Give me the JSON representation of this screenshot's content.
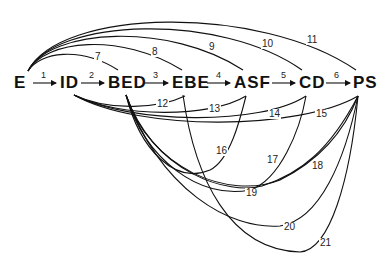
{
  "diagram": {
    "nodes": [
      {
        "id": "E",
        "label": "E",
        "x": 14,
        "y": 74
      },
      {
        "id": "ID",
        "label": "ID",
        "x": 60,
        "y": 74
      },
      {
        "id": "BED",
        "label": "BED",
        "x": 108,
        "y": 74
      },
      {
        "id": "EBE",
        "label": "EBE",
        "x": 172,
        "y": 74
      },
      {
        "id": "ASF",
        "label": "ASF",
        "x": 234,
        "y": 74
      },
      {
        "id": "CD",
        "label": "CD",
        "x": 299,
        "y": 74
      },
      {
        "id": "PS",
        "label": "PS",
        "x": 353,
        "y": 74
      }
    ],
    "sequential_edges": [
      {
        "label": "1",
        "from": "E",
        "to": "ID"
      },
      {
        "label": "2",
        "from": "ID",
        "to": "BED"
      },
      {
        "label": "3",
        "from": "BED",
        "to": "EBE"
      },
      {
        "label": "4",
        "from": "EBE",
        "to": "ASF"
      },
      {
        "label": "5",
        "from": "ASF",
        "to": "CD"
      },
      {
        "label": "6",
        "from": "CD",
        "to": "PS"
      }
    ],
    "upper_edges": [
      {
        "label": "7",
        "from": "E",
        "to": "BED"
      },
      {
        "label": "8",
        "from": "E",
        "to": "EBE"
      },
      {
        "label": "9",
        "from": "E",
        "to": "ASF"
      },
      {
        "label": "10",
        "from": "E",
        "to": "CD"
      },
      {
        "label": "11",
        "from": "E",
        "to": "PS"
      }
    ],
    "lower_edges": [
      {
        "label": "12",
        "from": "ID",
        "to": "EBE"
      },
      {
        "label": "13",
        "from": "ID",
        "to": "ASF"
      },
      {
        "label": "14",
        "from": "ID",
        "to": "CD"
      },
      {
        "label": "15",
        "from": "ID",
        "to": "PS"
      },
      {
        "label": "16",
        "from": "BED",
        "to": "ASF"
      },
      {
        "label": "17",
        "from": "BED",
        "to": "CD"
      },
      {
        "label": "18",
        "from": "BED",
        "to": "PS"
      },
      {
        "label": "19",
        "from": "EBE",
        "to": "CD"
      },
      {
        "label": "20",
        "from": "EBE",
        "to": "PS"
      },
      {
        "label": "21",
        "from": "ASF",
        "to": "PS"
      }
    ]
  }
}
